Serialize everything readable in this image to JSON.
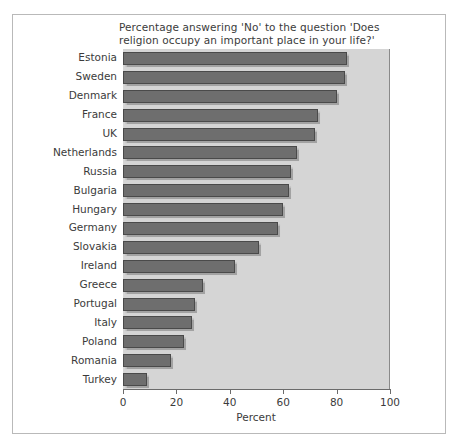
{
  "chart_data": {
    "type": "bar",
    "orientation": "horizontal",
    "title": "Percentage answering 'No' to the question 'Does religion occupy an important place in your life?'",
    "xlabel": "Percent",
    "ylabel": "",
    "xlim": [
      0,
      100
    ],
    "xticks": [
      0,
      20,
      40,
      60,
      80,
      100
    ],
    "grid": false,
    "legend": null,
    "categories": [
      "Estonia",
      "Sweden",
      "Denmark",
      "France",
      "UK",
      "Netherlands",
      "Russia",
      "Bulgaria",
      "Hungary",
      "Germany",
      "Slovakia",
      "Ireland",
      "Greece",
      "Portugal",
      "Italy",
      "Poland",
      "Romania",
      "Turkey"
    ],
    "values": [
      84,
      83,
      80,
      73,
      72,
      65,
      63,
      62,
      60,
      58,
      51,
      42,
      30,
      27,
      26,
      23,
      18,
      9
    ],
    "bar_color": "#6e6e6e",
    "panel_color": "#d5d5d5"
  }
}
